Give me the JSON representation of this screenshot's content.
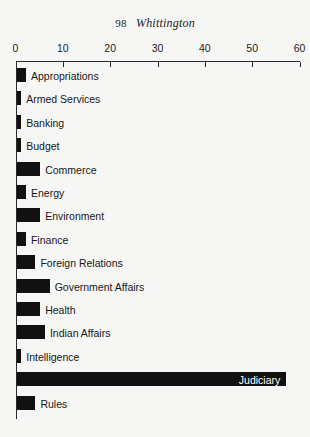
{
  "page": {
    "folio": "98",
    "running_title": "Whittington",
    "background_color": "#f6f6f5",
    "ink_color": "#111111"
  },
  "chart_data": {
    "type": "bar",
    "orientation": "horizontal",
    "title": "",
    "xlabel": "",
    "ylabel": "",
    "xlim": [
      0,
      60
    ],
    "xticks": [
      0,
      10,
      20,
      30,
      40,
      50,
      60
    ],
    "xtick_labels": [
      "0",
      "10",
      "20",
      "30",
      "40",
      "50",
      "60"
    ],
    "grid": false,
    "legend": null,
    "bar_color": "#111111",
    "categories": [
      "Appropriations",
      "Armed Services",
      "Banking",
      "Budget",
      "Commerce",
      "Energy",
      "Environment",
      "Finance",
      "Foreign Relations",
      "Government Affairs",
      "Health",
      "Indian Affairs",
      "Intelligence",
      "Judiciary",
      "Rules"
    ],
    "values": [
      2,
      1,
      1,
      1,
      5,
      2,
      5,
      2,
      4,
      7,
      5,
      6,
      1,
      57,
      4
    ],
    "label_placement": [
      "outside",
      "outside",
      "outside",
      "outside",
      "outside",
      "outside",
      "outside",
      "outside",
      "outside",
      "outside",
      "outside",
      "outside",
      "outside",
      "inside",
      "outside"
    ]
  }
}
